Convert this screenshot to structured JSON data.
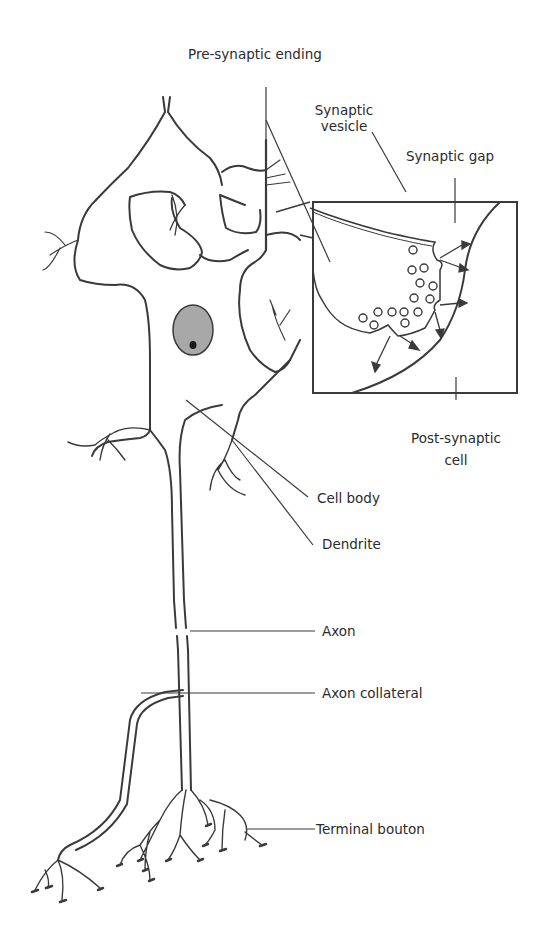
{
  "figure": {
    "labels": {
      "pre_synaptic_ending": "Pre-synaptic ending",
      "synaptic_vesicle_line1": "Synaptic",
      "synaptic_vesicle_line2": "vesicle",
      "synaptic_gap": "Synaptic gap",
      "post_synaptic_line1": "Post-synaptic",
      "post_synaptic_line2": "cell",
      "cell_body": "Cell body",
      "dendrite": "Dendrite",
      "axon": "Axon",
      "axon_collateral": "Axon collateral",
      "terminal_bouton": "Terminal bouton"
    },
    "caption_partial": "",
    "colors": {
      "ink": "#3a3a3a",
      "nucleus_fill": "#a8a8a8",
      "nucleolus": "#1a1a1a",
      "background": "#ffffff"
    }
  }
}
